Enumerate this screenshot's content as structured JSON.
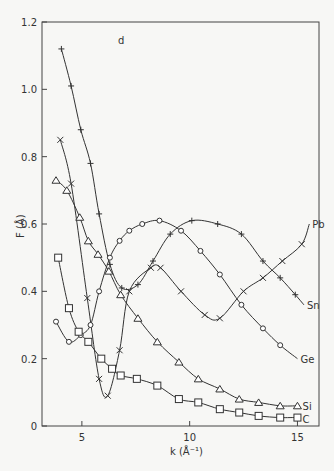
{
  "chart_data": {
    "type": "line",
    "title": "",
    "xlabel": "k (Å⁻¹)",
    "ylabel": "F (Å)",
    "xlim": [
      3.15,
      16.0
    ],
    "ylim": [
      0,
      1.2
    ],
    "xticks": [
      5,
      10,
      15
    ],
    "yticks": [
      0,
      0.2,
      0.4,
      0.6,
      0.8,
      1.0,
      1.2
    ],
    "ytick_labels": [
      "0",
      "0.2",
      "0.4",
      "0.6",
      "0.8",
      "1.0",
      "1.2"
    ],
    "grid": false,
    "legend": "inline labels at right end of curves",
    "corner_mark": "d",
    "series": [
      {
        "name": "Pb",
        "marker": "x",
        "x": [
          4.0,
          4.5,
          5.25,
          5.8,
          6.2,
          6.75,
          7.2,
          8.2,
          8.65,
          9.6,
          10.7,
          11.4,
          12.5,
          13.4,
          14.3,
          15.2
        ],
        "y": [
          0.85,
          0.72,
          0.38,
          0.14,
          0.09,
          0.225,
          0.4,
          0.47,
          0.47,
          0.4,
          0.33,
          0.32,
          0.4,
          0.44,
          0.49,
          0.54
        ],
        "label_end": [
          15.55,
          0.6
        ]
      },
      {
        "name": "Sn",
        "marker": "plus",
        "x": [
          4.05,
          4.5,
          4.95,
          5.4,
          5.8,
          6.3,
          6.85,
          7.6,
          8.3,
          9.1,
          10.1,
          11.3,
          12.4,
          13.4,
          14.2,
          14.9
        ],
        "y": [
          1.12,
          1.01,
          0.88,
          0.78,
          0.63,
          0.48,
          0.41,
          0.42,
          0.49,
          0.57,
          0.61,
          0.6,
          0.57,
          0.49,
          0.44,
          0.39
        ],
        "label_end": [
          15.3,
          0.36
        ]
      },
      {
        "name": "Ge",
        "marker": "circle",
        "x": [
          3.8,
          4.4,
          4.95,
          5.4,
          5.8,
          6.3,
          6.75,
          7.2,
          7.8,
          8.6,
          9.6,
          10.5,
          11.4,
          12.4,
          13.4,
          14.2
        ],
        "y": [
          0.31,
          0.25,
          0.27,
          0.3,
          0.4,
          0.5,
          0.55,
          0.58,
          0.6,
          0.61,
          0.58,
          0.52,
          0.45,
          0.36,
          0.29,
          0.24
        ],
        "label_end": [
          15.0,
          0.2
        ]
      },
      {
        "name": "Si",
        "marker": "triangle",
        "x": [
          3.8,
          4.3,
          4.9,
          5.3,
          5.75,
          6.25,
          6.8,
          7.6,
          8.5,
          9.5,
          10.4,
          11.4,
          12.3,
          13.2,
          14.2,
          15.0
        ],
        "y": [
          0.73,
          0.7,
          0.62,
          0.55,
          0.51,
          0.46,
          0.39,
          0.32,
          0.25,
          0.19,
          0.14,
          0.11,
          0.08,
          0.07,
          0.06,
          0.06
        ],
        "label_end": [
          15.1,
          0.06
        ]
      },
      {
        "name": "C",
        "marker": "square",
        "x": [
          3.9,
          4.4,
          4.85,
          5.3,
          5.9,
          6.4,
          6.8,
          7.55,
          8.5,
          9.5,
          10.4,
          11.4,
          12.3,
          13.2,
          14.2,
          15.0
        ],
        "y": [
          0.5,
          0.35,
          0.28,
          0.25,
          0.2,
          0.17,
          0.15,
          0.14,
          0.12,
          0.08,
          0.07,
          0.05,
          0.04,
          0.03,
          0.025,
          0.025
        ],
        "label_end": [
          15.1,
          0.02
        ]
      }
    ]
  }
}
